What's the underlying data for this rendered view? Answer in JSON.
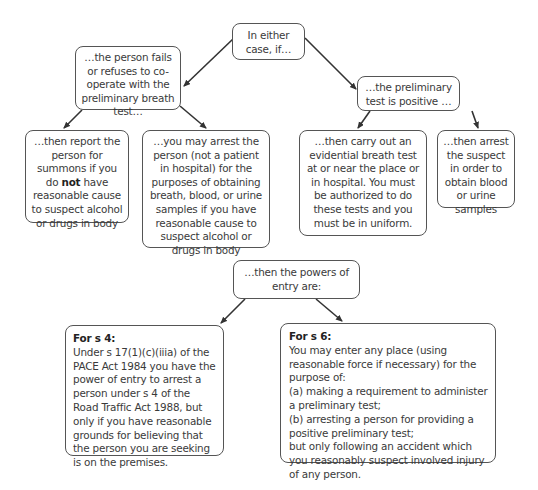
{
  "diagram": {
    "root": {
      "text": "In either case, if…"
    },
    "branch_fail": {
      "text": "…the person fails or refuses to co-operate with the preliminary breath test…"
    },
    "branch_positive": {
      "text": "…the preliminary test is positive …"
    },
    "report": {
      "before": "…then report the person for summons if you do ",
      "emphasis": "not",
      "after": " have reasonable cause to suspect alcohol or drugs in body"
    },
    "arrest_samples": {
      "text": "…you may arrest the person (not a patient in hospital) for the purposes of obtaining breath, blood, or urine samples if you have reasonable cause to suspect alcohol or drugs in body"
    },
    "evidential_test": {
      "text": "…then carry out an evidential breath test at or near the place or in hospital. You must be authorized to do these tests and you must be in uniform."
    },
    "arrest_suspect": {
      "text": "…then arrest the suspect in order to obtain blood or urine samples"
    },
    "powers_of_entry": {
      "text": "…then the powers of entry are:"
    },
    "s4": {
      "title": "For s 4:",
      "text": "Under s 17(1)(c)(iiia) of the PACE Act 1984 you have the power of entry to arrest a person under s 4 of the Road Traffic Act 1988, but only if you have reasonable grounds for believing that the person you are seeking is on the premises."
    },
    "s6": {
      "title": "For s 6:",
      "lines": [
        "You may enter any place (using reasonable force if necessary) for the purpose of:",
        "(a) making a requirement to administer a preliminary test;",
        "(b) arresting a person for providing a positive preliminary test;",
        "but only following an accident which you reasonably suspect involved injury of any person."
      ]
    }
  },
  "colors": {
    "border": "#555555",
    "text": "#3a3a3a",
    "arrow": "#333333"
  }
}
